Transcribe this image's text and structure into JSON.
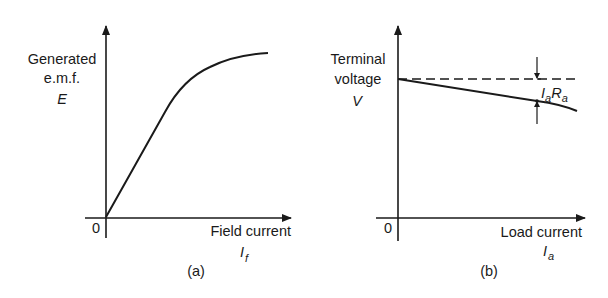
{
  "figure": {
    "panels": [
      {
        "id": "a",
        "caption": "(a)",
        "y_label_lines": [
          "Generated",
          "e.m.f.",
          "E"
        ],
        "origin_label": "0",
        "x_label": "Field current",
        "x_symbol_main": "I",
        "x_symbol_sub": "f",
        "curve_description": "Magnetisation curve: linear rise from origin then saturation"
      },
      {
        "id": "b",
        "caption": "(b)",
        "y_label_lines": [
          "Terminal",
          "voltage",
          "V"
        ],
        "origin_label": "0",
        "x_label": "Load current",
        "x_symbol_main": "I",
        "x_symbol_sub": "a",
        "annotation_main1": "I",
        "annotation_sub1": "a",
        "annotation_main2": "R",
        "annotation_sub2": "a",
        "curve_description": "Terminal voltage drops slightly with load current; dashed line is no-load e.m.f.; gap marked IaRa"
      }
    ],
    "colors": {
      "ink": "#1a1a1a",
      "background": "#ffffff"
    }
  }
}
